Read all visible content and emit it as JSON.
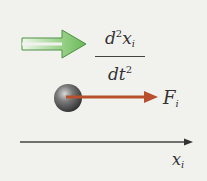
{
  "diagram": {
    "derivative": {
      "numerator": "d",
      "numerator_power": "2",
      "numerator_var": "x",
      "numerator_sub": "i",
      "denominator": "dt",
      "denominator_power": "2"
    },
    "force": {
      "symbol": "F",
      "subscript": "i"
    },
    "axis": {
      "symbol": "x",
      "subscript": "i"
    },
    "colors": {
      "background": "#f1f1ee",
      "green_arrow": "#7fc46e",
      "green_arrow_edge": "#4f8f45",
      "force_arrow": "#b8502e",
      "particle": "#5a5a5a",
      "axis": "#444444"
    }
  }
}
